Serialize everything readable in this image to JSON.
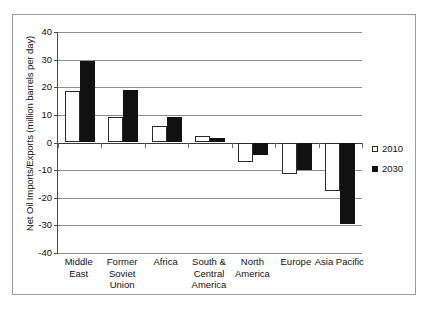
{
  "chart_data": {
    "type": "bar",
    "title": "",
    "xlabel": "",
    "ylabel": "Net Oil Imports/Exports (million barrels per day)",
    "ylim": [
      -40,
      40
    ],
    "ytick_step": 10,
    "yticks": [
      40,
      30,
      20,
      10,
      0,
      -10,
      -20,
      -30,
      -40
    ],
    "ytick_labels": [
      "40",
      "30",
      "20",
      "10",
      "0",
      "-10",
      "-20",
      "-30",
      "-40"
    ],
    "grid": true,
    "legend_position": "right",
    "categories": [
      "Middle East",
      "Former Soviet Union",
      "Africa",
      "South & Central America",
      "North America",
      "Europe",
      "Asia Pacific"
    ],
    "category_lines": [
      [
        "Middle",
        "East"
      ],
      [
        "Former",
        "Soviet",
        "Union"
      ],
      [
        "Africa"
      ],
      [
        "South &",
        "Central",
        "America"
      ],
      [
        "North",
        "America"
      ],
      [
        "Europe"
      ],
      [
        "Asia Pacific"
      ]
    ],
    "series": [
      {
        "name": "2010",
        "color": "#ffffff",
        "edge_color": "#2b2b2b",
        "values": [
          18.5,
          9.3,
          6.0,
          2.4,
          -7.0,
          -11.5,
          -17.5
        ]
      },
      {
        "name": "2030",
        "color": "#111111",
        "edge_color": "#111111",
        "values": [
          29.5,
          19.0,
          9.3,
          1.8,
          -4.5,
          -10.0,
          -29.5
        ]
      }
    ]
  },
  "legend": {
    "items": [
      {
        "label": "2010",
        "swatch": "hollow-square-icon"
      },
      {
        "label": "2030",
        "swatch": "filled-square-icon"
      }
    ]
  }
}
